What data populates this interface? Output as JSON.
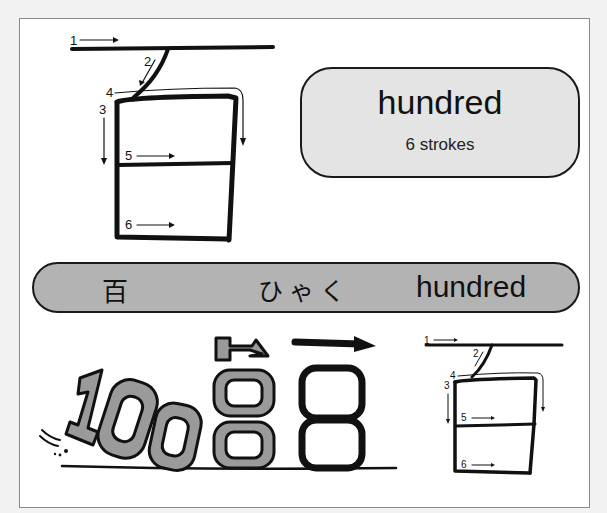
{
  "card": {
    "meaning": "hundred",
    "stroke_count_label": "6 strokes"
  },
  "banner": {
    "kanji": "百",
    "reading": "ひゃく",
    "meaning": "hundred"
  },
  "stroke_diagram_large": {
    "labels": [
      "1",
      "2",
      "3",
      "4",
      "5",
      "6"
    ]
  },
  "stroke_diagram_small": {
    "labels": [
      "1",
      "2",
      "3",
      "4",
      "5",
      "6"
    ]
  },
  "mnemonic_illustration": {
    "depicts": "100"
  },
  "colors": {
    "banner_fill": "#b3b3b3",
    "card_fill": "#e4e4e4",
    "ink": "#111111",
    "mnemonic_gray": "#9a9a9a"
  }
}
